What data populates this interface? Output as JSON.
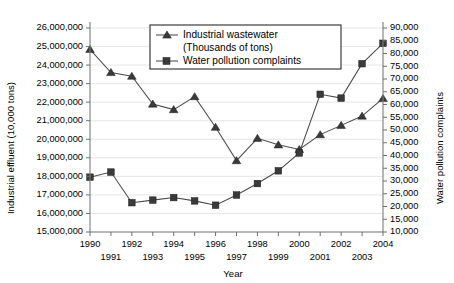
{
  "chart_data": {
    "type": "line",
    "title": "",
    "xlabel": "Year",
    "ylabel": "Industrial effluent (10,000 tons)",
    "y2label": "Water pollution complaints",
    "grid": true,
    "legend_position": "top-center",
    "x": [
      1990,
      1991,
      1992,
      1993,
      1994,
      1995,
      1996,
      1997,
      1998,
      1999,
      2000,
      2001,
      2002,
      2003,
      2004
    ],
    "categories": [
      "1990",
      "1991",
      "1992",
      "1993",
      "1994",
      "1995",
      "1996",
      "1997",
      "1998",
      "1999",
      "2000",
      "2001",
      "2002",
      "2003",
      "2004"
    ],
    "xlim": [
      1990,
      2004
    ],
    "ylim": [
      15000000,
      26000000
    ],
    "y2lim": [
      10000,
      90000
    ],
    "yticks": [
      15000000,
      16000000,
      17000000,
      18000000,
      19000000,
      20000000,
      21000000,
      22000000,
      23000000,
      24000000,
      25000000,
      26000000
    ],
    "ytick_labels": [
      "15,000,000",
      "16,000,000",
      "17,000,000",
      "18,000,000",
      "19,000,000",
      "20,000,000",
      "21,000,000",
      "22,000,000",
      "23,000,000",
      "24,000,000",
      "25,000,000",
      "26,000,000"
    ],
    "y2ticks": [
      10000,
      15000,
      20000,
      25000,
      30000,
      35000,
      40000,
      45000,
      50000,
      55000,
      60000,
      65000,
      70000,
      75000,
      80000,
      85000,
      90000
    ],
    "y2tick_labels": [
      "10,000",
      "15,000",
      "20,000",
      "25,000",
      "30,000",
      "35,000",
      "40,000",
      "45,000",
      "50,000",
      "55,000",
      "60,000",
      "65,000",
      "70,000",
      "75,000",
      "80,000",
      "85,000",
      "90,000"
    ],
    "xtick_labels_top": [
      "1990",
      "1992",
      "1994",
      "1996",
      "1998",
      "2000",
      "2002",
      "2004"
    ],
    "xtick_labels_bottom": [
      "1991",
      "1993",
      "1995",
      "1997",
      "1999",
      "2001",
      "2003"
    ],
    "series": [
      {
        "name": "Industrial wastewater",
        "name_line2": "(Thousands of tons)",
        "axis": "left",
        "marker": "triangle",
        "color": "#3a3a3a",
        "values": [
          24850000,
          23600000,
          23400000,
          21900000,
          21600000,
          22300000,
          20650000,
          18850000,
          20050000,
          19700000,
          19450000,
          20250000,
          20750000,
          21250000,
          22200000
        ]
      },
      {
        "name": "Water pollution complaints",
        "axis": "right",
        "marker": "square",
        "color": "#3a3a3a",
        "values": [
          31500,
          33500,
          21500,
          22500,
          23500,
          22200,
          20500,
          24500,
          29000,
          34000,
          41000,
          64000,
          62500,
          76000,
          84000
        ]
      }
    ]
  },
  "legend": {
    "entries": [
      {
        "label": "Industrial wastewater",
        "label2": "(Thousands of tons)",
        "marker": "triangle"
      },
      {
        "label": "Water pollution complaints",
        "label2": "",
        "marker": "square"
      }
    ]
  },
  "colors": {
    "series": "#3a3a3a",
    "axis": "#7b7b7b",
    "grid": "#e2e2e2",
    "background": "#ffffff"
  }
}
